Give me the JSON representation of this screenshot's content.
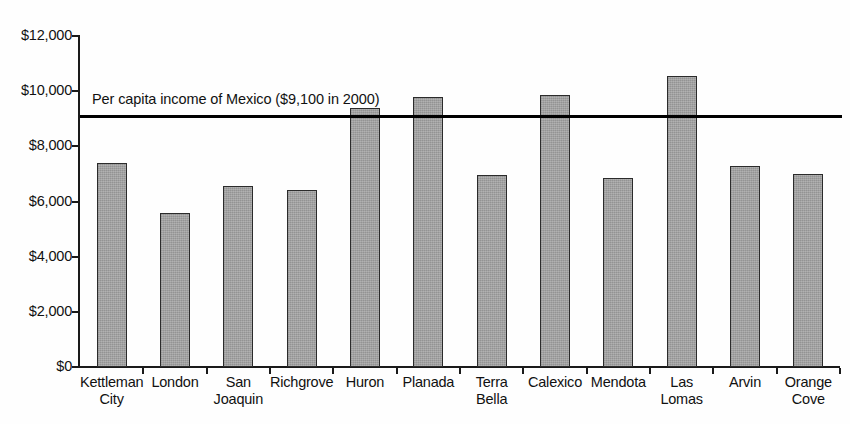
{
  "chart_data": {
    "type": "bar",
    "title": "",
    "xlabel": "",
    "ylabel": "",
    "ylim": [
      0,
      12000
    ],
    "ytick_labels": [
      "$12,000",
      "$10,000",
      "$8,000",
      "$6,000",
      "$4,000",
      "$2,000",
      "$0"
    ],
    "ytick_values": [
      12000,
      10000,
      8000,
      6000,
      4000,
      2000,
      0
    ],
    "grid": false,
    "legend": null,
    "categories": [
      "Kettleman City",
      "London",
      "San Joaquin",
      "Richgrove",
      "Huron",
      "Planada",
      "Terra Bella",
      "Calexico",
      "Mendota",
      "Las Lomas",
      "Arvin",
      "Orange Cove"
    ],
    "category_lines": [
      [
        "Kettleman",
        "City"
      ],
      [
        "London",
        ""
      ],
      [
        "San",
        "Joaquin"
      ],
      [
        "Richgrove",
        ""
      ],
      [
        "Huron",
        ""
      ],
      [
        "Planada",
        ""
      ],
      [
        "Terra",
        "Bella"
      ],
      [
        "Calexico",
        ""
      ],
      [
        "Mendota",
        ""
      ],
      [
        "Las",
        "Lomas"
      ],
      [
        "Arvin",
        ""
      ],
      [
        "Orange",
        "Cove"
      ]
    ],
    "values": [
      7400,
      5600,
      6550,
      6400,
      9400,
      9800,
      6950,
      9850,
      6850,
      10550,
      7300,
      7000
    ],
    "annotations": [
      {
        "name": "mexico-reference-line",
        "label": "Per capita income of Mexico ($9,100 in 2000)",
        "value": 9100
      }
    ]
  },
  "style": {
    "bar_fill": "#9b9b9b",
    "bar_stroke": "#2b2b2b",
    "axis_color": "#1a1a1a",
    "reference_line_color": "#000000",
    "background": "#ffffff"
  }
}
